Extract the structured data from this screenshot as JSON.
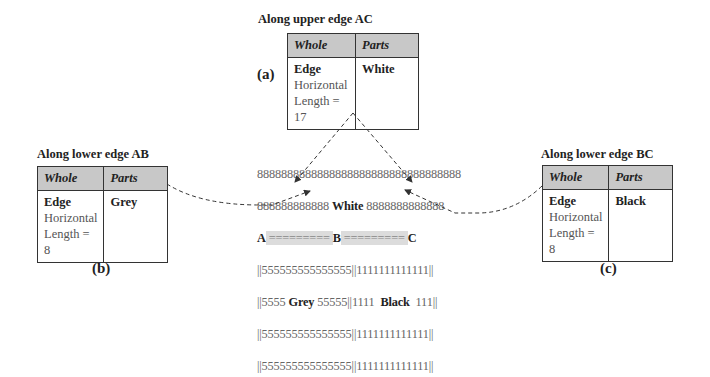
{
  "panel_a": {
    "caption": "Along upper edge AC",
    "label": "(a)",
    "headers": [
      "Whole",
      "Parts"
    ],
    "whole": {
      "name": "Edge",
      "orientation": "Horizontal",
      "length": "Length = 17"
    },
    "parts": "White"
  },
  "panel_b": {
    "caption": "Along lower edge AB",
    "label": "(b)",
    "headers": [
      "Whole",
      "Parts"
    ],
    "whole": {
      "name": "Edge",
      "orientation": "Horizontal",
      "length": "Length = 8"
    },
    "parts": "Grey"
  },
  "panel_c": {
    "caption": "Along lower edge BC",
    "label": "(c)",
    "headers": [
      "Whole",
      "Parts"
    ],
    "whole": {
      "name": "Edge",
      "orientation": "Horizontal",
      "length": "Length = 8"
    },
    "parts": "Black"
  },
  "grid": {
    "row1": "8888888888888888888888888888888888",
    "row2_left": "888888888888 ",
    "row2_word": "White",
    "row2_right": " 8888888888888",
    "corner_a": "A",
    "edge_ab": " ========= ",
    "corner_b": "B",
    "edge_bc": " ========= ",
    "corner_c": "C",
    "row4": "||555555555555555||1111111111111||",
    "row5_left": "||5555 ",
    "row5_grey": "Grey",
    "row5_mid": " 55555||1111  ",
    "row5_black": "Black",
    "row5_right": "  111||",
    "row6": "||555555555555555||1111111111111||",
    "row7": "||555555555555555||1111111111111||"
  },
  "colors": {
    "header_fill": "#c8c8c8",
    "edge_highlight": "#dcdcdc",
    "line": "#333333"
  }
}
